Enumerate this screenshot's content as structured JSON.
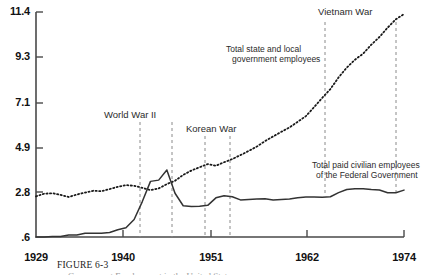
{
  "figure": {
    "caption_label": "FIGURE 6-3",
    "caption_subtitle": "Government Employment in the United States"
  },
  "chart_data": {
    "type": "line",
    "title": "",
    "subtitle": "",
    "xlabel": "",
    "ylabel": "",
    "grid": false,
    "legend": "annotated-inline",
    "xlim": [
      1929,
      1974
    ],
    "ylim": [
      0.6,
      11.4
    ],
    "xtick_labels": [
      "1929",
      "1940",
      "1951",
      "1962",
      "1974"
    ],
    "xtick_values": [
      1929,
      1940,
      1951,
      1962,
      1974
    ],
    "ytick_labels": [
      "11.4",
      "9.3",
      "7.1",
      "4.9",
      "2.8",
      ".6"
    ],
    "ytick_values": [
      11.4,
      9.3,
      7.1,
      4.9,
      2.8,
      0.6
    ],
    "series": [
      {
        "name": "Total state and local government employees",
        "style": "dotted",
        "color": "#1a1a1a",
        "x": [
          1929,
          1930,
          1931,
          1932,
          1933,
          1934,
          1935,
          1936,
          1937,
          1938,
          1939,
          1940,
          1941,
          1942,
          1943,
          1944,
          1945,
          1946,
          1947,
          1948,
          1949,
          1950,
          1951,
          1952,
          1953,
          1954,
          1955,
          1956,
          1957,
          1958,
          1959,
          1960,
          1961,
          1962,
          1963,
          1964,
          1965,
          1966,
          1967,
          1968,
          1969,
          1970,
          1971,
          1972,
          1973,
          1974
        ],
        "values": [
          2.55,
          2.68,
          2.7,
          2.62,
          2.52,
          2.64,
          2.73,
          2.82,
          2.8,
          2.9,
          3.01,
          3.09,
          3.06,
          2.96,
          2.85,
          2.93,
          3.14,
          3.3,
          3.58,
          3.79,
          3.95,
          4.1,
          4.02,
          4.19,
          4.34,
          4.53,
          4.73,
          4.94,
          5.2,
          5.43,
          5.65,
          5.86,
          6.13,
          6.4,
          6.83,
          7.28,
          7.7,
          8.26,
          8.73,
          9.11,
          9.4,
          9.83,
          10.2,
          10.65,
          11.05,
          11.3
        ]
      },
      {
        "name": "Total paid civilian employees of the Federal Government",
        "style": "solid",
        "color": "#333333",
        "x": [
          1929,
          1930,
          1931,
          1932,
          1933,
          1934,
          1935,
          1936,
          1937,
          1938,
          1939,
          1940,
          1941,
          1942,
          1943,
          1944,
          1945,
          1946,
          1947,
          1948,
          1949,
          1950,
          1951,
          1952,
          1953,
          1954,
          1955,
          1956,
          1957,
          1958,
          1959,
          1960,
          1961,
          1962,
          1963,
          1964,
          1965,
          1966,
          1967,
          1968,
          1969,
          1970,
          1971,
          1972,
          1973,
          1974
        ],
        "values": [
          0.6,
          0.6,
          0.62,
          0.62,
          0.7,
          0.7,
          0.78,
          0.78,
          0.78,
          0.82,
          0.95,
          1.04,
          1.44,
          2.3,
          3.27,
          3.33,
          3.82,
          2.7,
          2.1,
          2.07,
          2.08,
          2.12,
          2.48,
          2.58,
          2.53,
          2.38,
          2.4,
          2.42,
          2.44,
          2.38,
          2.4,
          2.42,
          2.48,
          2.52,
          2.52,
          2.51,
          2.53,
          2.73,
          2.88,
          2.92,
          2.92,
          2.88,
          2.86,
          2.72,
          2.72,
          2.85
        ]
      }
    ],
    "event_markers": [
      {
        "label": "World War II",
        "start": 1941,
        "end": 1945
      },
      {
        "label": "Korean War",
        "start": 1950,
        "end": 1953
      },
      {
        "label": "Vietnam War",
        "start": 1964,
        "end": 1973
      }
    ],
    "annotations": [
      {
        "name": "state-local-label",
        "text_line1": "Total state and local",
        "text_line2": "government employees"
      },
      {
        "name": "federal-label",
        "text_line1": "Total paid civilian employees",
        "text_line2": "of the Federal Government"
      }
    ]
  }
}
